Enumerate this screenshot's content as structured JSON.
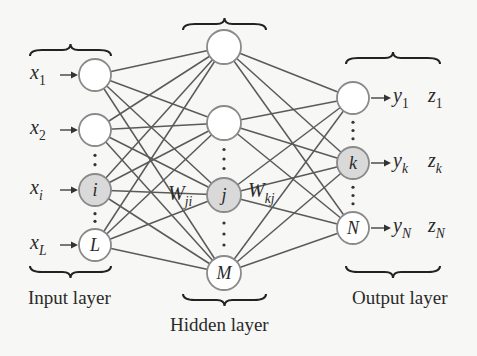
{
  "diagram": {
    "type": "neural-network",
    "colors": {
      "background": "#f7f7f5",
      "node_stroke": "#8a8a8a",
      "node_fill": "#ffffff",
      "highlight_fill": "#d9d9d9",
      "edge": "#5a5a5a"
    },
    "layers": [
      {
        "id": "input",
        "label": "Input layer",
        "x": 95,
        "r": 16,
        "nodes": [
          {
            "id": "x1",
            "y": 75,
            "text": "",
            "highlight": false,
            "input_label": "x",
            "input_sub": "1"
          },
          {
            "id": "x2",
            "y": 130,
            "text": "",
            "highlight": false,
            "input_label": "x",
            "input_sub": "2"
          },
          {
            "id": "xi",
            "y": 190,
            "text": "i",
            "highlight": true,
            "input_label": "x",
            "input_sub": "i"
          },
          {
            "id": "xL",
            "y": 245,
            "text": "L",
            "highlight": false,
            "input_label": "x",
            "input_sub": "L"
          }
        ]
      },
      {
        "id": "hidden",
        "label": "Hidden layer",
        "x": 224,
        "r": 17,
        "nodes": [
          {
            "id": "h1",
            "y": 47,
            "text": "",
            "highlight": false
          },
          {
            "id": "h2",
            "y": 123,
            "text": "",
            "highlight": false
          },
          {
            "id": "hj",
            "y": 195,
            "text": "j",
            "highlight": true
          },
          {
            "id": "hM",
            "y": 273,
            "text": "M",
            "highlight": false
          }
        ]
      },
      {
        "id": "output",
        "label": "Output layer",
        "x": 353,
        "r": 16,
        "nodes": [
          {
            "id": "y1",
            "y": 98,
            "text": "",
            "highlight": false,
            "out_y": "y",
            "out_y_sub": "1",
            "out_z": "z",
            "out_z_sub": "1"
          },
          {
            "id": "yk",
            "y": 163,
            "text": "k",
            "highlight": true,
            "out_y": "y",
            "out_y_sub": "k",
            "out_z": "z",
            "out_z_sub": "k"
          },
          {
            "id": "yN",
            "y": 228,
            "text": "N",
            "highlight": false,
            "out_y": "y",
            "out_y_sub": "N",
            "out_z": "z",
            "out_z_sub": "N"
          }
        ]
      }
    ],
    "weights": [
      {
        "label": "W",
        "sub": "ji",
        "x": 168,
        "y": 200
      },
      {
        "label": "W",
        "sub": "kj",
        "x": 248,
        "y": 197
      }
    ],
    "labels": {
      "input_layer": "Input layer",
      "hidden_layer": "Hidden layer",
      "output_layer": "Output layer"
    }
  }
}
